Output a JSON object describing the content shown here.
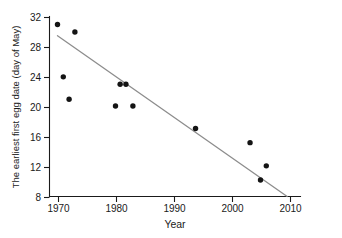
{
  "chart_data": {
    "type": "scatter",
    "title": "",
    "xlabel": "Year",
    "ylabel": "The earliest first egg date (day of May)",
    "xlim": [
      1968,
      2012
    ],
    "ylim": [
      8,
      32
    ],
    "xticks": [
      1970,
      1980,
      1990,
      2000,
      2010
    ],
    "xtick_labels": [
      "1970",
      "1980",
      "1990",
      "2000",
      "2010"
    ],
    "yticks": [
      8,
      12,
      16,
      20,
      24,
      28,
      32
    ],
    "ytick_labels": [
      "8",
      "12",
      "16",
      "20",
      "24",
      "28",
      "32"
    ],
    "grid": false,
    "legend": null,
    "point_color": "#141414",
    "trendline_color": "#8d8d8d",
    "axis_color": "#1a1a1a",
    "points": [
      {
        "x": 1970.0,
        "y": 31.0
      },
      {
        "x": 1971.0,
        "y": 24.0
      },
      {
        "x": 1972.0,
        "y": 21.0
      },
      {
        "x": 1973.0,
        "y": 30.0
      },
      {
        "x": 1980.0,
        "y": 20.1
      },
      {
        "x": 1980.8,
        "y": 23.0
      },
      {
        "x": 1981.8,
        "y": 23.0
      },
      {
        "x": 1983.0,
        "y": 20.1
      },
      {
        "x": 1993.8,
        "y": 17.1
      },
      {
        "x": 2003.2,
        "y": 15.2
      },
      {
        "x": 2005.0,
        "y": 10.2
      },
      {
        "x": 2006.0,
        "y": 12.1
      }
    ],
    "trendline": {
      "x_start": 1970.0,
      "y_start": 29.5,
      "x_end": 2009.6,
      "y_end": 8.0
    }
  }
}
